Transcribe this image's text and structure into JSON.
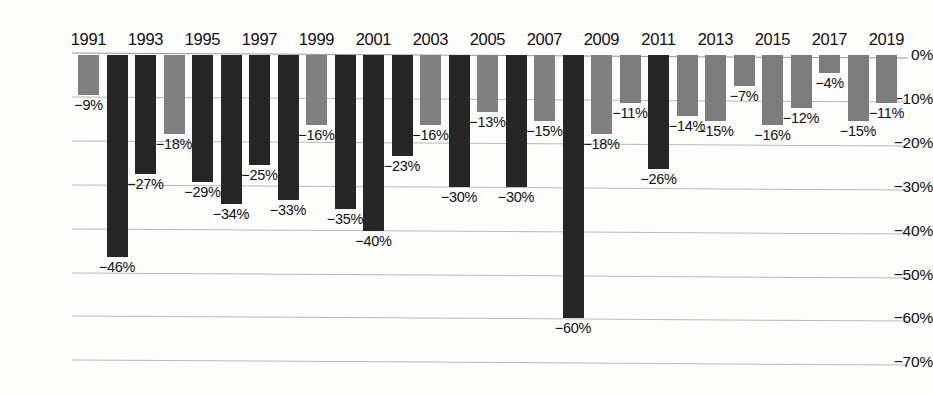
{
  "chart_data": {
    "type": "bar",
    "title": "",
    "subtitle": "",
    "xlabel": "",
    "ylabel": "",
    "ylim": [
      -70,
      0
    ],
    "ytick_labels": [
      "0%",
      "−10%",
      "−20%",
      "−30%",
      "−40%",
      "−50%",
      "−60%",
      "−70%"
    ],
    "ytick_values": [
      0,
      -10,
      -20,
      -30,
      -40,
      -50,
      -60,
      -70
    ],
    "grid": true,
    "legend": "none",
    "categories": [
      1991,
      1992,
      1993,
      1994,
      1995,
      1996,
      1997,
      1998,
      1999,
      2000,
      2001,
      2002,
      2003,
      2004,
      2005,
      2006,
      2007,
      2008,
      2009,
      2010,
      2011,
      2012,
      2013,
      2014,
      2015,
      2016,
      2017,
      2018,
      2019
    ],
    "values": [
      -9,
      -46,
      -27,
      -18,
      -29,
      -34,
      -25,
      -33,
      -16,
      -35,
      -40,
      -23,
      -16,
      -30,
      -13,
      -30,
      -15,
      -60,
      -18,
      -11,
      -26,
      -14,
      -15,
      -7,
      -16,
      -12,
      -4,
      -15,
      -11
    ],
    "data_labels": [
      "−9%",
      "−46%",
      "−27%",
      "−18%",
      "−29%",
      "−34%",
      "−25%",
      "−33%",
      "−16%",
      "−35%",
      "−40%",
      "−23%",
      "−16%",
      "−30%",
      "−13%",
      "−30%",
      "−15%",
      "−60%",
      "−18%",
      "−11%",
      "−26%",
      "−14%",
      "−15%",
      "−7%",
      "−16%",
      "−12%",
      "−4%",
      "−15%",
      "−11%"
    ],
    "bar_styles": [
      "gray",
      "dark",
      "dark",
      "gray",
      "dark",
      "dark",
      "dark",
      "dark",
      "gray",
      "dark",
      "dark",
      "dark",
      "gray",
      "dark",
      "gray",
      "dark",
      "gray",
      "dark",
      "gray",
      "gray2",
      "dark",
      "gray2",
      "gray2",
      "gray2",
      "gray2",
      "gray2",
      "gray2",
      "gray2",
      "gray2"
    ],
    "visible_x_tick_labels": [
      "1991",
      "1993",
      "1995",
      "1997",
      "1999",
      "2001",
      "2003",
      "2005",
      "2007",
      "2009",
      "2011",
      "2013",
      "2015",
      "2017",
      "2019"
    ],
    "colors": {
      "dark_bar": "#262626",
      "gray_bar": "#808080",
      "gray_bar_light": "#7c7c7c",
      "gridline": "#b9b9b9",
      "text": "#111111",
      "background": "#fdfdfc"
    }
  }
}
